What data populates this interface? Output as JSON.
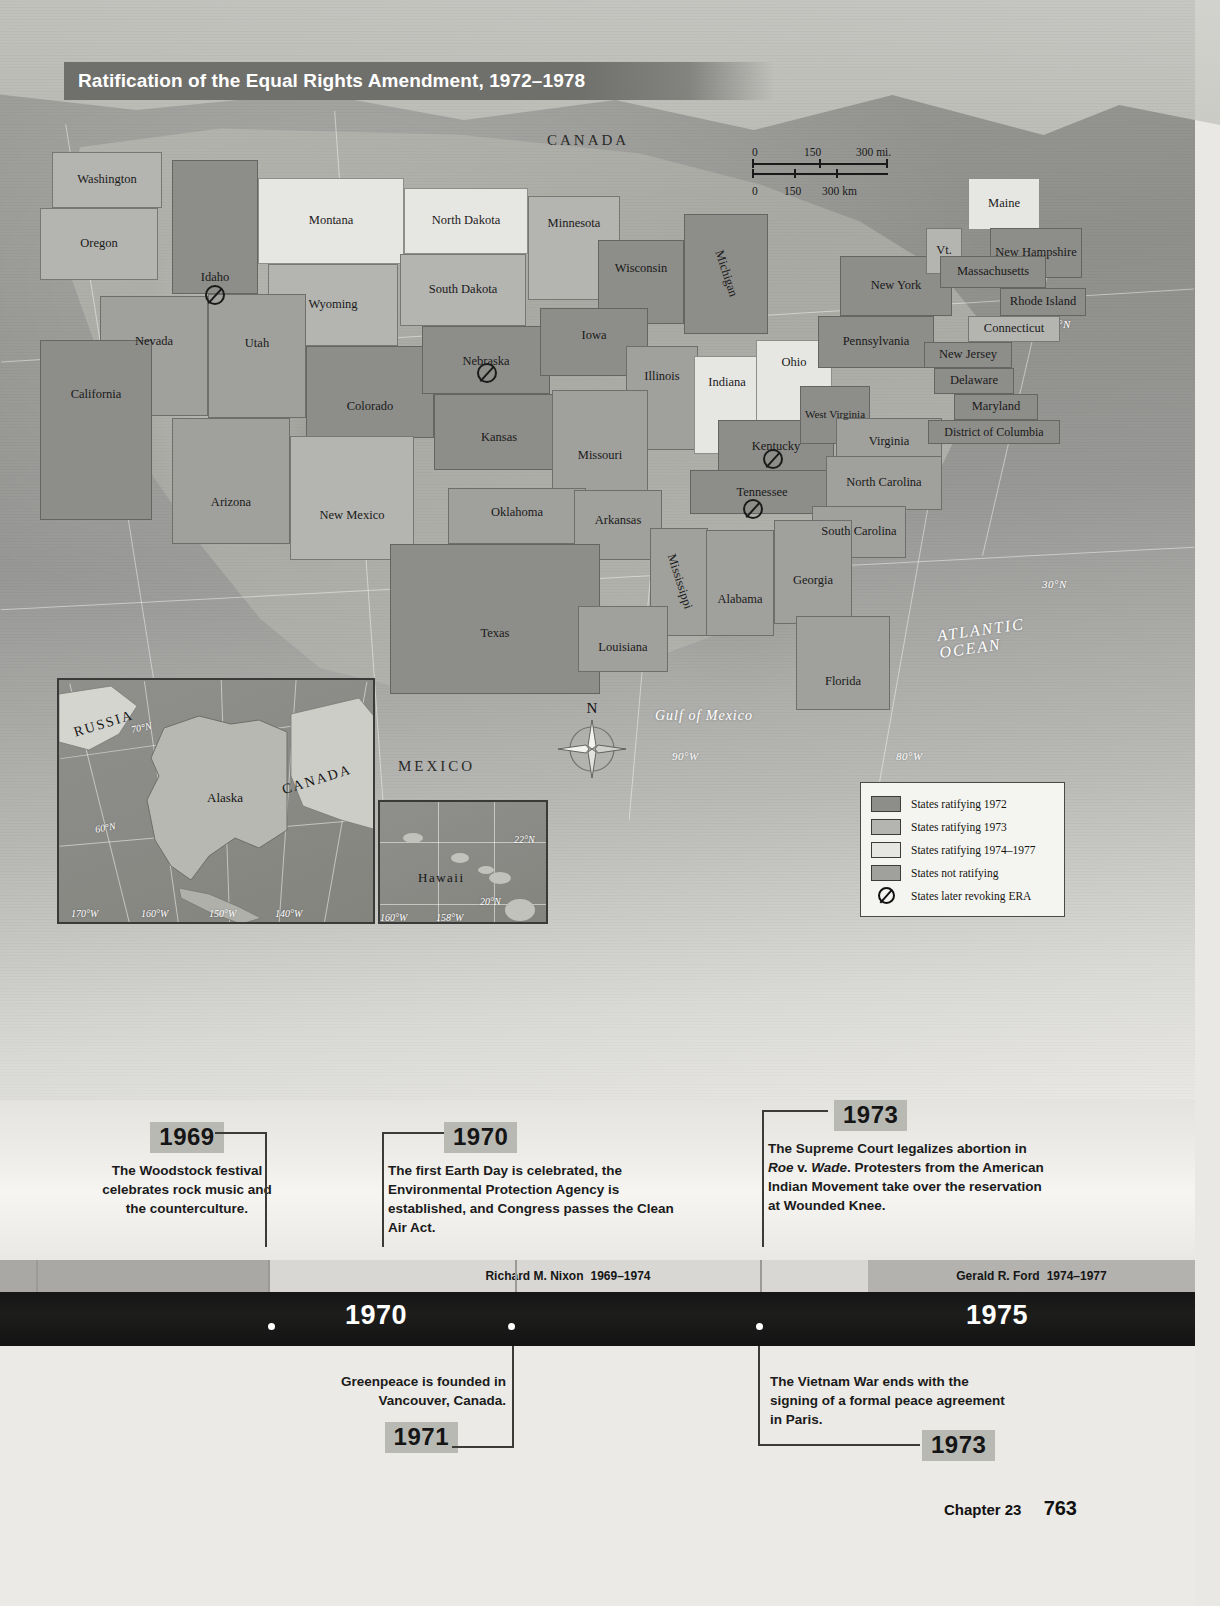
{
  "map": {
    "title": "Ratification of the Equal Rights Amendment, 1972–1978",
    "scale": {
      "miles": [
        "0",
        "150",
        "300 mi."
      ],
      "km": [
        "0",
        "150",
        "300 km"
      ]
    },
    "compass_north": "N",
    "regions": [
      "CANADA",
      "MEXICO"
    ],
    "oceans": [
      "ATLANTIC OCEAN",
      "Gulf of Mexico"
    ],
    "graticule": [
      "40°N",
      "30°N",
      "70°W",
      "80°W",
      "90°W"
    ],
    "states": [
      {
        "name": "Washington",
        "cls": "c1973"
      },
      {
        "name": "Oregon",
        "cls": "c1973"
      },
      {
        "name": "Idaho",
        "cls": "c1972",
        "revoked": true
      },
      {
        "name": "Montana",
        "cls": "c1974"
      },
      {
        "name": "Wyoming",
        "cls": "c1973"
      },
      {
        "name": "North Dakota",
        "cls": "c1974"
      },
      {
        "name": "South Dakota",
        "cls": "c1973"
      },
      {
        "name": "Minnesota",
        "cls": "c1973"
      },
      {
        "name": "Wisconsin",
        "cls": "c1972"
      },
      {
        "name": "Michigan",
        "cls": "c1972"
      },
      {
        "name": "Nevada",
        "cls": "cnone"
      },
      {
        "name": "Utah",
        "cls": "cnone"
      },
      {
        "name": "California",
        "cls": "c1972"
      },
      {
        "name": "Colorado",
        "cls": "c1972"
      },
      {
        "name": "Nebraska",
        "cls": "c1972",
        "revoked": true
      },
      {
        "name": "Iowa",
        "cls": "c1972"
      },
      {
        "name": "Illinois",
        "cls": "cnone"
      },
      {
        "name": "Indiana",
        "cls": "c1974"
      },
      {
        "name": "Ohio",
        "cls": "c1974"
      },
      {
        "name": "Arizona",
        "cls": "cnone"
      },
      {
        "name": "New Mexico",
        "cls": "c1973"
      },
      {
        "name": "Kansas",
        "cls": "c1972"
      },
      {
        "name": "Missouri",
        "cls": "cnone"
      },
      {
        "name": "Kentucky",
        "cls": "c1972",
        "revoked": true
      },
      {
        "name": "West Virginia",
        "cls": "c1972"
      },
      {
        "name": "Virginia",
        "cls": "cnone"
      },
      {
        "name": "Oklahoma",
        "cls": "cnone"
      },
      {
        "name": "Arkansas",
        "cls": "cnone"
      },
      {
        "name": "Tennessee",
        "cls": "c1972",
        "revoked": true
      },
      {
        "name": "North Carolina",
        "cls": "cnone"
      },
      {
        "name": "South Carolina",
        "cls": "cnone"
      },
      {
        "name": "Mississippi",
        "cls": "cnone"
      },
      {
        "name": "Alabama",
        "cls": "cnone"
      },
      {
        "name": "Georgia",
        "cls": "cnone"
      },
      {
        "name": "Texas",
        "cls": "c1972"
      },
      {
        "name": "Louisiana",
        "cls": "cnone"
      },
      {
        "name": "Florida",
        "cls": "cnone"
      },
      {
        "name": "New York",
        "cls": "c1972"
      },
      {
        "name": "Pennsylvania",
        "cls": "c1972"
      },
      {
        "name": "Maine",
        "cls": "c1974"
      },
      {
        "name": "Vt.",
        "cls": "c1973"
      },
      {
        "name": "New Hampshire",
        "cls": "c1972"
      },
      {
        "name": "Massachusetts",
        "cls": "c1972"
      },
      {
        "name": "Rhode Island",
        "cls": "c1972"
      },
      {
        "name": "Connecticut",
        "cls": "c1973"
      },
      {
        "name": "New Jersey",
        "cls": "c1972"
      },
      {
        "name": "Delaware",
        "cls": "c1972"
      },
      {
        "name": "Maryland",
        "cls": "c1972"
      },
      {
        "name": "District of Columbia",
        "cls": "c1972"
      }
    ],
    "insets": {
      "alaska": {
        "labels": [
          "RUSSIA",
          "Alaska",
          "CANADA"
        ],
        "graticule": [
          "70°N",
          "60°N",
          "170°W",
          "160°W",
          "150°W",
          "140°W"
        ]
      },
      "hawaii": {
        "labels": [
          "Hawaii"
        ],
        "graticule": [
          "22°N",
          "20°N",
          "160°W",
          "158°W"
        ]
      }
    },
    "legend": {
      "items": [
        {
          "label": "States ratifying 1972",
          "swatch": "#8d8d89",
          "symbol": "swatch"
        },
        {
          "label": "States ratifying 1973",
          "swatch": "#b4b4b0",
          "symbol": "swatch"
        },
        {
          "label": "States ratifying 1974–1977",
          "swatch": "#e6e6e2",
          "symbol": "swatch"
        },
        {
          "label": "States not ratifying",
          "swatch": "#a0a09c",
          "symbol": "swatch"
        },
        {
          "label": "States later revoking ERA",
          "swatch": "",
          "symbol": "no-entry-icon"
        }
      ]
    }
  },
  "timeline": {
    "above_events": [
      {
        "year": "1969",
        "text": "The Woodstock festival celebrates rock music and the counterculture."
      },
      {
        "year": "1970",
        "text": "The first Earth Day is celebrated, the Environmental Protection Agency is established, and Congress passes the Clean Air Act."
      },
      {
        "year": "1973",
        "text_html": "The Supreme Court legalizes abortion in <i>Roe</i> v. <i>Wade</i>. Protesters from the American Indian Movement take over the reservation at Wounded Knee."
      }
    ],
    "presidents": [
      {
        "name": "Richard M. Nixon",
        "years": "1969–1974"
      },
      {
        "name": "Gerald R. Ford",
        "years": "1974–1977"
      }
    ],
    "era_years": [
      "1970",
      "1975"
    ],
    "below_events": [
      {
        "year": "1971",
        "text": "Greenpeace is founded in Vancouver, Canada."
      },
      {
        "year": "1973",
        "text": "The Vietnam War ends with the signing of a formal peace agreement in Paris."
      }
    ]
  },
  "footer": {
    "chapter": "Chapter 23",
    "page": "763"
  }
}
